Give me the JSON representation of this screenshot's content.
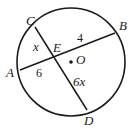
{
  "diagram": {
    "type": "circle-intersecting-chords",
    "circle": {
      "center_label": "O",
      "cx": 71,
      "cy": 62,
      "r": 54
    },
    "points": {
      "A": {
        "label": "A",
        "x": 20,
        "y": 70
      },
      "B": {
        "label": "B",
        "x": 115,
        "y": 33
      },
      "C": {
        "label": "C",
        "x": 35,
        "y": 27
      },
      "D": {
        "label": "D",
        "x": 87,
        "y": 110
      },
      "E": {
        "label": "E",
        "x": 54,
        "y": 58
      },
      "O": {
        "label": "O",
        "x": 71,
        "y": 62
      }
    },
    "chords": [
      {
        "from": "A",
        "to": "B"
      },
      {
        "from": "C",
        "to": "D"
      }
    ],
    "segment_labels": {
      "CE": "x",
      "EB": "4",
      "AE": "6",
      "ED": "6x"
    }
  }
}
